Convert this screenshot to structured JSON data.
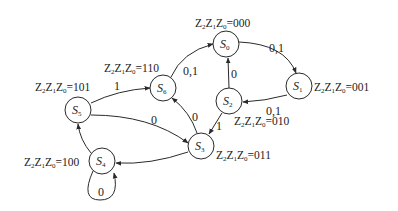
{
  "diagram": {
    "type": "state-machine",
    "colors": {
      "stroke": "#2a2a2a",
      "text": "#222222",
      "background": "#ffffff"
    },
    "states": [
      {
        "id": "S0",
        "name": "S",
        "sub": "0",
        "output_prefix": "Z",
        "output_subs": [
          "2",
          "1",
          "0"
        ],
        "output_value": "=000"
      },
      {
        "id": "S1",
        "name": "S",
        "sub": "1",
        "output_prefix": "Z",
        "output_subs": [
          "2",
          "1",
          "0"
        ],
        "output_value": "=001"
      },
      {
        "id": "S2",
        "name": "S",
        "sub": "2",
        "output_prefix": "Z",
        "output_subs": [
          "2",
          "1",
          "0"
        ],
        "output_value": "=010"
      },
      {
        "id": "S3",
        "name": "S",
        "sub": "3",
        "output_prefix": "Z",
        "output_subs": [
          "2",
          "1",
          "0"
        ],
        "output_value": "=011"
      },
      {
        "id": "S4",
        "name": "S",
        "sub": "4",
        "output_prefix": "Z",
        "output_subs": [
          "2",
          "1",
          "0"
        ],
        "output_value": "=100"
      },
      {
        "id": "S5",
        "name": "S",
        "sub": "5",
        "output_prefix": "Z",
        "output_subs": [
          "2",
          "1",
          "0"
        ],
        "output_value": "=101"
      },
      {
        "id": "S6",
        "name": "S",
        "sub": "6",
        "output_prefix": "Z",
        "output_subs": [
          "2",
          "1",
          "0"
        ],
        "output_value": "=110"
      }
    ],
    "transitions": [
      {
        "from": "S0",
        "to": "S1",
        "label": "0,1"
      },
      {
        "from": "S1",
        "to": "S2",
        "label": "0,1"
      },
      {
        "from": "S2",
        "to": "S0",
        "label": "0"
      },
      {
        "from": "S2",
        "to": "S3",
        "label": "1"
      },
      {
        "from": "S3",
        "to": "S6",
        "label": "0"
      },
      {
        "from": "S6",
        "to": "S0",
        "label": "0,1"
      },
      {
        "from": "S5",
        "to": "S6",
        "label": "1"
      },
      {
        "from": "S5",
        "to": "S3",
        "label": "0"
      },
      {
        "from": "S3",
        "to": "S4",
        "label": ""
      },
      {
        "from": "S4",
        "to": "S5",
        "label": ""
      },
      {
        "from": "S4",
        "to": "S4",
        "label": "0"
      }
    ]
  }
}
